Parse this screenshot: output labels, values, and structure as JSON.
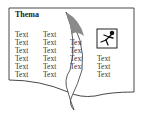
{
  "document": {
    "title": "Thema",
    "columns": [
      {
        "rows": [
          "Text",
          "Text",
          "Text",
          "Text",
          "Text",
          "Text"
        ]
      },
      {
        "rows": [
          "Text",
          "Text",
          "Text",
          "Text",
          "Text",
          "Text"
        ]
      },
      {
        "rows": [
          "Text",
          "Text",
          "Text",
          "Text",
          "Text",
          "Text"
        ]
      },
      {
        "rows": [
          "Text",
          "Text",
          "Text"
        ]
      }
    ],
    "image_icon": "running-figure-icon",
    "effect": "page-curl"
  },
  "colors": {
    "curl_shade": "#8a8a8a",
    "border": "#333333"
  }
}
